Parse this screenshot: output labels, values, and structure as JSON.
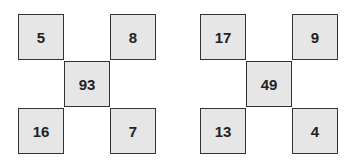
{
  "puzzles": [
    {
      "top_left": "5",
      "top_right": "8",
      "center": "93",
      "bottom_left": "16",
      "bottom_right": "7"
    },
    {
      "top_left": "17",
      "top_right": "9",
      "center": "49",
      "bottom_left": "13",
      "bottom_right": "4"
    }
  ]
}
